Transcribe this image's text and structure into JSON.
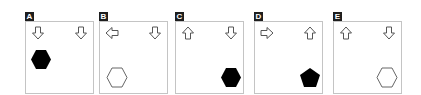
{
  "options": [
    {
      "label": "A",
      "left_arrow": "down",
      "right_arrow": "down",
      "shape": "hexagon",
      "fill": "#000000",
      "position": "top-left"
    },
    {
      "label": "B",
      "left_arrow": "left",
      "right_arrow": "down",
      "shape": "hexagon",
      "fill": "none",
      "position": "bottom-left"
    },
    {
      "label": "C",
      "left_arrow": "up",
      "right_arrow": "down",
      "shape": "hexagon",
      "fill": "#000000",
      "position": "bottom-right"
    },
    {
      "label": "D",
      "left_arrow": "right",
      "right_arrow": "up",
      "shape": "pentagon",
      "fill": "#000000",
      "position": "bottom-right"
    },
    {
      "label": "E",
      "left_arrow": "up",
      "right_arrow": "down",
      "shape": "hexagon",
      "fill": "none",
      "position": "bottom-right"
    }
  ]
}
